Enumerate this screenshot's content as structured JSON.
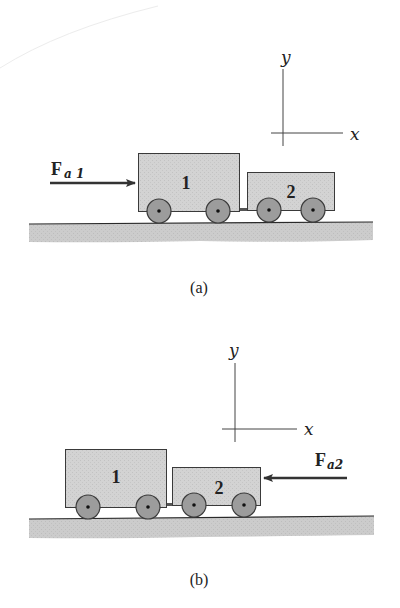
{
  "colors": {
    "background": "#ffffff",
    "cart_fill": "#d6d6d6",
    "cart_stroke": "#3a3a3a",
    "wheel_fill": "#9c9c9c",
    "wheel_stroke": "#3a3a3a",
    "ground_fill": "#cfcfcf",
    "ground_line": "#2a2a2a",
    "arrow": "#333333",
    "axis": "#444444",
    "text": "#222222"
  },
  "panels": [
    {
      "id": "a",
      "caption": "(a)",
      "axes": {
        "x_label": "x",
        "y_label": "y"
      },
      "force": {
        "symbol": "F",
        "subscript": "a 1",
        "direction": "right",
        "applied_to": "cart 1"
      },
      "carts": [
        {
          "label": "1",
          "wheels": 2
        },
        {
          "label": "2",
          "wheels": 2
        }
      ]
    },
    {
      "id": "b",
      "caption": "(b)",
      "axes": {
        "x_label": "x",
        "y_label": "y"
      },
      "force": {
        "symbol": "F",
        "subscript": "a2",
        "direction": "left",
        "applied_to": "cart 2"
      },
      "carts": [
        {
          "label": "1",
          "wheels": 2
        },
        {
          "label": "2",
          "wheels": 2
        }
      ]
    }
  ]
}
